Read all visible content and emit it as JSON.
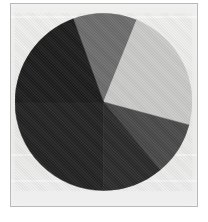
{
  "figure": {
    "background_color": "#ebebea",
    "border_color": "#b9b9b8",
    "title": "",
    "caption": ""
  },
  "chart_data": {
    "type": "pie",
    "title": "",
    "subtitle": "",
    "xlabel": "",
    "ylabel": "",
    "grid": false,
    "legend_position": "none",
    "center": {
      "x": 102,
      "y": 101
    },
    "radius": 88,
    "total": 100,
    "start_angle_deg": 110,
    "direction": "clockwise",
    "categories": [
      "Slice 1",
      "Slice 2",
      "Slice 3",
      "Slice 4",
      "Slice 5",
      "Slice 6"
    ],
    "values": [
      11.7,
      23.1,
      11.1,
      11.1,
      25.0,
      18.0
    ],
    "angles_deg": [
      42,
      83,
      40,
      40,
      90,
      65
    ],
    "boundaries_deg": [
      110,
      68,
      345,
      310,
      270,
      180
    ],
    "colors": [
      "#6d6d6d",
      "#c9c9c7",
      "#4a4a4a",
      "#2a2a2a",
      "#232323",
      "#1f1f1f"
    ],
    "slices": [
      {
        "label": "Slice 1",
        "value": 11.7,
        "color": "#6d6d6d",
        "start_deg": 68,
        "end_deg": 110
      },
      {
        "label": "Slice 2",
        "value": 23.1,
        "color": "#c9c9c7",
        "start_deg": 345,
        "end_deg": 68
      },
      {
        "label": "Slice 3",
        "value": 11.1,
        "color": "#4a4a4a",
        "start_deg": 310,
        "end_deg": 345
      },
      {
        "label": "Slice 4",
        "value": 11.1,
        "color": "#2b2b2b",
        "start_deg": 270,
        "end_deg": 310
      },
      {
        "label": "Slice 5",
        "value": 25.0,
        "color": "#232323",
        "start_deg": 180,
        "end_deg": 270
      },
      {
        "label": "Slice 6",
        "value": 18.0,
        "color": "#1d1d1d",
        "start_deg": 110,
        "end_deg": 180
      }
    ]
  }
}
